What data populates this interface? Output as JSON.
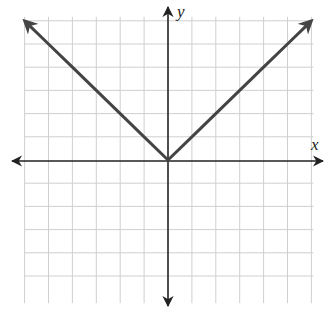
{
  "chart_data": {
    "type": "line",
    "title": "",
    "function": "y = |x|",
    "xlabel": "x",
    "ylabel": "y",
    "xlim": [
      -6,
      6
    ],
    "ylim": [
      -6,
      6
    ],
    "grid": true,
    "grid_step": 1,
    "tick_labels": false,
    "series": [
      {
        "name": "y = |x|",
        "x": [
          -6,
          -5,
          -4,
          -3,
          -2,
          -1,
          0,
          1,
          2,
          3,
          4,
          5,
          6
        ],
        "y": [
          6,
          5,
          4,
          3,
          2,
          1,
          0,
          1,
          2,
          3,
          4,
          5,
          6
        ],
        "arrows_at_ends": true
      }
    ],
    "colors": {
      "line": "#444444",
      "axes": "#222222",
      "grid": "#cfcfcf"
    }
  },
  "labels": {
    "x_axis": "x",
    "y_axis": "y"
  }
}
